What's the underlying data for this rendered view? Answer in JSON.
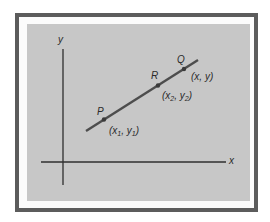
{
  "diagram": {
    "type": "coordinate-line",
    "axes": {
      "x_label": "x",
      "y_label": "y"
    },
    "points": [
      {
        "name": "P",
        "coord_label": "(x1, y1)",
        "coord_base": [
          "x",
          "y"
        ],
        "coord_sub": "1"
      },
      {
        "name": "R",
        "coord_label": "(x2, y2)",
        "coord_base": [
          "x",
          "y"
        ],
        "coord_sub": "2"
      },
      {
        "name": "Q",
        "coord_label": "(x, y)"
      }
    ],
    "colors": {
      "frame": "#5c5c5c",
      "panel": "#c7c7c7",
      "line": "#4d4d4d",
      "axis": "#2f2f2f"
    }
  }
}
